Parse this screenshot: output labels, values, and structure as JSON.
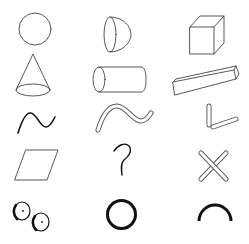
{
  "title": "Shape primitives",
  "background": "#ffffff",
  "stroke_colors": {
    "thin": "#444444",
    "thick": "#111111"
  },
  "grid": {
    "rows": 5,
    "columns": 3
  },
  "shapes": [
    {
      "row": 1,
      "col": 1,
      "name": "sphere",
      "label": "Sphere"
    },
    {
      "row": 1,
      "col": 2,
      "name": "hemisphere",
      "label": "Hemisphere"
    },
    {
      "row": 1,
      "col": 3,
      "name": "cube",
      "label": "Cube"
    },
    {
      "row": 2,
      "col": 1,
      "name": "cone",
      "label": "Cone"
    },
    {
      "row": 2,
      "col": 2,
      "name": "cylinder",
      "label": "Cylinder"
    },
    {
      "row": 2,
      "col": 3,
      "name": "rectangular-prism",
      "label": "Rectangular prism"
    },
    {
      "row": 3,
      "col": 1,
      "name": "wave-line",
      "label": "Wave line"
    },
    {
      "row": 3,
      "col": 2,
      "name": "wave-tube",
      "label": "Wave tube"
    },
    {
      "row": 3,
      "col": 3,
      "name": "l-tubes",
      "label": "L-shaped tubes"
    },
    {
      "row": 4,
      "col": 1,
      "name": "parallelogram",
      "label": "Parallelogram"
    },
    {
      "row": 4,
      "col": 2,
      "name": "hook-curve",
      "label": "Hook curve"
    },
    {
      "row": 4,
      "col": 3,
      "name": "x-tubes",
      "label": "Crossed tubes"
    },
    {
      "row": 5,
      "col": 1,
      "name": "wheels",
      "label": "Wheels"
    },
    {
      "row": 5,
      "col": 2,
      "name": "ring",
      "label": "Ring"
    },
    {
      "row": 5,
      "col": 3,
      "name": "arc",
      "label": "Arc"
    }
  ]
}
